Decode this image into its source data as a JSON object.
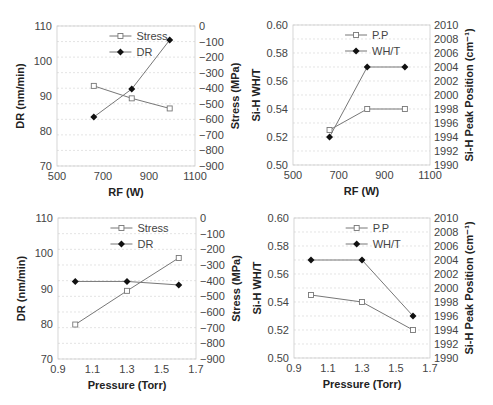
{
  "chart_data": [
    {
      "type": "line",
      "panel": "top-left",
      "xlabel": "RF (W)",
      "ylabel": "DR (nm/min)",
      "y2label": "Stress (MPa)",
      "xlim": [
        500,
        1100
      ],
      "xticks": [
        500,
        700,
        900,
        1100
      ],
      "ylim": [
        70,
        110
      ],
      "yticks": [
        70,
        80,
        90,
        100,
        110
      ],
      "y2lim": [
        -900,
        0
      ],
      "y2ticks": [
        0,
        -100,
        -200,
        -300,
        -400,
        -500,
        -600,
        -700,
        -800,
        -900
      ],
      "grid": true,
      "legend_position": "top-center",
      "x": [
        660,
        825,
        990
      ],
      "series": [
        {
          "name": "Stress",
          "axis": "right",
          "marker": "open-square",
          "values": [
            -385,
            -465,
            -530
          ]
        },
        {
          "name": "DR",
          "axis": "left",
          "marker": "filled-diamond",
          "values": [
            84,
            92,
            106
          ]
        }
      ]
    },
    {
      "type": "line",
      "panel": "top-right",
      "xlabel": "RF (W)",
      "ylabel": "Si-H WH/T",
      "y2label": "Si-H Peak Position (cm⁻¹)",
      "xlim": [
        500,
        1100
      ],
      "xticks": [
        500,
        700,
        900,
        1100
      ],
      "ylim": [
        0.5,
        0.6
      ],
      "yticks": [
        "0.50",
        "0.52",
        "0.54",
        "0.56",
        "0.58",
        "0.60"
      ],
      "y2lim": [
        1990,
        2010
      ],
      "y2ticks": [
        1990,
        1992,
        1994,
        1996,
        1998,
        2000,
        2002,
        2004,
        2006,
        2008,
        2010
      ],
      "grid": true,
      "legend_position": "top-center",
      "x": [
        660,
        825,
        990
      ],
      "series": [
        {
          "name": "P.P",
          "axis": "right",
          "marker": "open-square",
          "values": [
            1995,
            1998,
            1998
          ]
        },
        {
          "name": "WH/T",
          "axis": "left",
          "marker": "filled-diamond",
          "values": [
            0.52,
            0.57,
            0.57
          ]
        }
      ]
    },
    {
      "type": "line",
      "panel": "bottom-left",
      "xlabel": "Pressure (Torr)",
      "ylabel": "DR (nm/min)",
      "y2label": "Stress (MPa)",
      "xlim": [
        0.9,
        1.7
      ],
      "xticks": [
        "0.9",
        "1.1",
        "1.3",
        "1.5",
        "1.7"
      ],
      "ylim": [
        70,
        110
      ],
      "yticks": [
        70,
        80,
        90,
        100,
        110
      ],
      "y2lim": [
        -900,
        0
      ],
      "y2ticks": [
        0,
        -100,
        -200,
        -300,
        -400,
        -500,
        -600,
        -700,
        -800,
        -900
      ],
      "grid": true,
      "legend_position": "top-center",
      "x": [
        1.0,
        1.3,
        1.6
      ],
      "series": [
        {
          "name": "Stress",
          "axis": "right",
          "marker": "open-square",
          "values": [
            -680,
            -465,
            -255
          ]
        },
        {
          "name": "DR",
          "axis": "left",
          "marker": "filled-diamond",
          "values": [
            92,
            92,
            91
          ]
        }
      ]
    },
    {
      "type": "line",
      "panel": "bottom-right",
      "xlabel": "Pressure (Torr)",
      "ylabel": "Si-H WH/T",
      "y2label": "Si-H Peak Position (cm⁻¹)",
      "xlim": [
        0.9,
        1.7
      ],
      "xticks": [
        "0.9",
        "1.1",
        "1.3",
        "1.5",
        "1.7"
      ],
      "ylim": [
        0.5,
        0.6
      ],
      "yticks": [
        "0.50",
        "0.52",
        "0.54",
        "0.56",
        "0.58",
        "0.60"
      ],
      "y2lim": [
        1990,
        2010
      ],
      "y2ticks": [
        1990,
        1992,
        1994,
        1996,
        1998,
        2000,
        2002,
        2004,
        2006,
        2008,
        2010
      ],
      "grid": true,
      "legend_position": "top-center",
      "x": [
        1.0,
        1.3,
        1.6
      ],
      "series": [
        {
          "name": "P.P",
          "axis": "right",
          "marker": "open-square",
          "values": [
            1999,
            1998,
            1994
          ]
        },
        {
          "name": "WH/T",
          "axis": "left",
          "marker": "filled-diamond",
          "values": [
            0.57,
            0.57,
            0.53
          ]
        }
      ]
    }
  ],
  "layout": [
    {
      "left": 57,
      "right": 195,
      "top": 26,
      "bottom": 166
    },
    {
      "left": 293,
      "right": 430,
      "top": 25,
      "bottom": 165
    },
    {
      "left": 58,
      "right": 196,
      "top": 218,
      "bottom": 359
    },
    {
      "left": 294,
      "right": 430,
      "top": 218,
      "bottom": 358
    }
  ],
  "colors": {
    "line": "#777777",
    "grid": "#d8d8d8",
    "axis": "#cccccc",
    "text": "#444444",
    "label": "#222222",
    "marker_fill": "#111111"
  }
}
